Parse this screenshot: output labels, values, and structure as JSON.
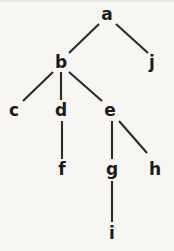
{
  "diagram": {
    "kind": "tree",
    "background_color": "#f7f6f3",
    "node_color": "#1b1b1b",
    "edge_color": "#2a2a2a",
    "nodes": [
      {
        "id": "a",
        "label": "a",
        "x": 107,
        "y": 14
      },
      {
        "id": "b",
        "label": "b",
        "x": 61,
        "y": 62
      },
      {
        "id": "j",
        "label": "j",
        "x": 152,
        "y": 62
      },
      {
        "id": "c",
        "label": "c",
        "x": 14,
        "y": 110
      },
      {
        "id": "d",
        "label": "d",
        "x": 61,
        "y": 110
      },
      {
        "id": "e",
        "label": "e",
        "x": 110,
        "y": 110
      },
      {
        "id": "f",
        "label": "f",
        "x": 62,
        "y": 169
      },
      {
        "id": "g",
        "label": "g",
        "x": 112,
        "y": 169
      },
      {
        "id": "h",
        "label": "h",
        "x": 155,
        "y": 169
      },
      {
        "id": "i",
        "label": "i",
        "x": 112,
        "y": 233
      }
    ],
    "edges": [
      {
        "id": "edge-a-b",
        "from": "a",
        "to": "b",
        "x1": 99,
        "y1": 24,
        "x2": 69,
        "y2": 53
      },
      {
        "id": "edge-a-j",
        "from": "a",
        "to": "j",
        "x1": 116,
        "y1": 24,
        "x2": 148,
        "y2": 53
      },
      {
        "id": "edge-b-c",
        "from": "b",
        "to": "c",
        "x1": 53,
        "y1": 72,
        "x2": 23,
        "y2": 101
      },
      {
        "id": "edge-b-d",
        "from": "b",
        "to": "d",
        "x1": 61,
        "y1": 72,
        "x2": 61,
        "y2": 100
      },
      {
        "id": "edge-b-e",
        "from": "b",
        "to": "e",
        "x1": 69,
        "y1": 72,
        "x2": 102,
        "y2": 101
      },
      {
        "id": "edge-d-f",
        "from": "d",
        "to": "f",
        "x1": 62,
        "y1": 121,
        "x2": 62,
        "y2": 159
      },
      {
        "id": "edge-e-g",
        "from": "e",
        "to": "g",
        "x1": 112,
        "y1": 121,
        "x2": 112,
        "y2": 159
      },
      {
        "id": "edge-e-h",
        "from": "e",
        "to": "h",
        "x1": 119,
        "y1": 121,
        "x2": 147,
        "y2": 153
      },
      {
        "id": "edge-g-i",
        "from": "g",
        "to": "i",
        "x1": 112,
        "y1": 181,
        "x2": 112,
        "y2": 222
      }
    ]
  }
}
